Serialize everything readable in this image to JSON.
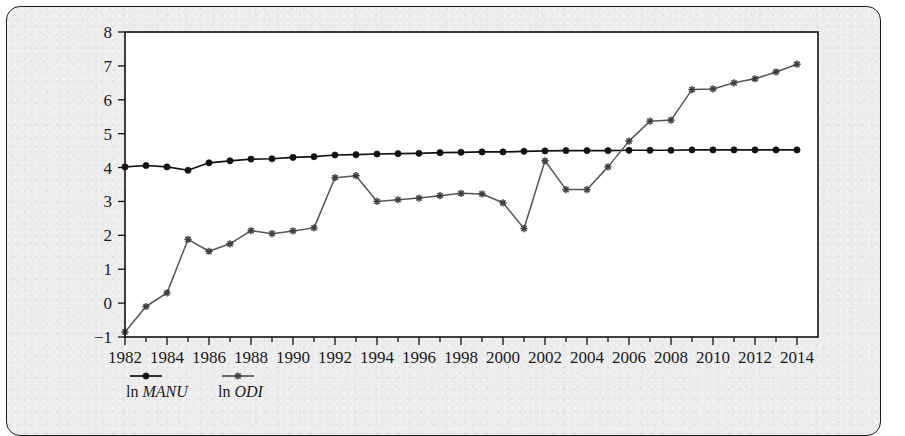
{
  "figure": {
    "panel_background": "#ececec",
    "panel_border_color": "#1a1a1a",
    "plot_background": "#ffffff"
  },
  "legend": {
    "position": "bottom-left",
    "entries": [
      {
        "prefix": "ln",
        "name": "MANU",
        "marker": "filled-circle",
        "color": "#121212"
      },
      {
        "prefix": "ln",
        "name": "ODI",
        "marker": "asterisk",
        "color": "#555555"
      }
    ]
  },
  "chart_data": {
    "type": "line",
    "title": "",
    "subtitle": "",
    "xlabel": "",
    "ylabel": "",
    "xlim": [
      1982,
      2015
    ],
    "ylim": [
      -1,
      8
    ],
    "ytick_labels": [
      "8",
      "7",
      "6",
      "5",
      "4",
      "3",
      "2",
      "1",
      "0",
      "−1"
    ],
    "yticks": [
      8,
      7,
      6,
      5,
      4,
      3,
      2,
      1,
      0,
      -1
    ],
    "xtick_labels": [
      "1982",
      "1984",
      "1986",
      "1988",
      "1990",
      "1992",
      "1994",
      "1996",
      "1998",
      "2000",
      "2002",
      "2004",
      "2006",
      "2008",
      "2010",
      "2012",
      "2014"
    ],
    "xticks": [
      1982,
      1984,
      1986,
      1988,
      1990,
      1992,
      1994,
      1996,
      1998,
      2000,
      2002,
      2004,
      2006,
      2008,
      2010,
      2012,
      2014
    ],
    "x": [
      1982,
      1983,
      1984,
      1985,
      1986,
      1987,
      1988,
      1989,
      1990,
      1991,
      1992,
      1993,
      1994,
      1995,
      1996,
      1997,
      1998,
      1999,
      2000,
      2001,
      2002,
      2003,
      2004,
      2005,
      2006,
      2007,
      2008,
      2009,
      2010,
      2011,
      2012,
      2013,
      2014
    ],
    "grid": false,
    "legend_position": "below-axes-left",
    "series": [
      {
        "name": "ln MANU",
        "marker": "filled-circle",
        "color": "#121212",
        "values": [
          4.02,
          4.06,
          4.02,
          3.92,
          4.14,
          4.2,
          4.25,
          4.26,
          4.3,
          4.32,
          4.37,
          4.38,
          4.4,
          4.41,
          4.42,
          4.44,
          4.45,
          4.46,
          4.46,
          4.48,
          4.49,
          4.5,
          4.5,
          4.5,
          4.51,
          4.51,
          4.51,
          4.52,
          4.52,
          4.52,
          4.52,
          4.52,
          4.52
        ]
      },
      {
        "name": "ln ODI",
        "marker": "asterisk",
        "color": "#555555",
        "values": [
          -0.85,
          -0.1,
          0.3,
          1.88,
          1.53,
          1.75,
          2.14,
          2.05,
          2.13,
          2.22,
          3.7,
          3.76,
          3.0,
          3.05,
          3.1,
          3.17,
          3.24,
          3.22,
          2.96,
          2.2,
          4.2,
          3.35,
          3.35,
          4.02,
          4.78,
          5.37,
          5.4,
          6.3,
          6.32,
          6.5,
          6.62,
          6.82,
          7.05
        ]
      }
    ]
  }
}
